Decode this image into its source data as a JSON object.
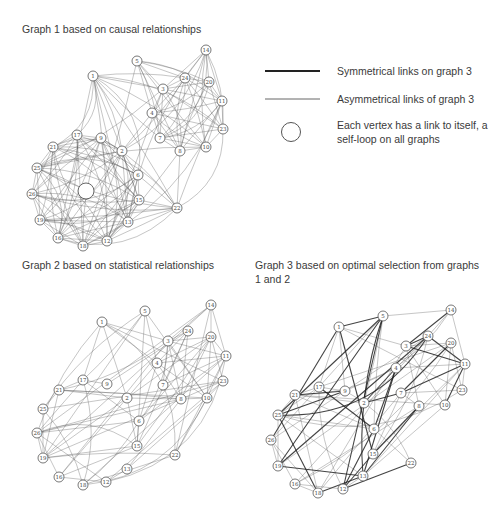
{
  "titles": {
    "graph1": "Graph 1 based on causal relationships",
    "graph2": "Graph 2 based on statistical relationships",
    "graph3": "Graph 3 based on optimal selection from graphs 1 and 2"
  },
  "legend": {
    "items": [
      {
        "symbol": "thick-line",
        "label": "Symmetrical links on graph 3"
      },
      {
        "symbol": "thin-line",
        "label": "Asymmetrical links of graph 3"
      },
      {
        "symbol": "circle",
        "label": "Each vertex has a link to itself, a self-loop on all graphs"
      }
    ]
  },
  "colors": {
    "edge": "#555555",
    "edge_light": "#8a8a8a",
    "edge_strong": "#222222",
    "text": "#3a3a3a"
  },
  "graphs": [
    {
      "id": "graph1",
      "nodes": [
        {
          "id": "1",
          "x": 93,
          "y": 76
        },
        {
          "id": "5",
          "x": 137,
          "y": 61
        },
        {
          "id": "14",
          "x": 206,
          "y": 50
        },
        {
          "id": "24",
          "x": 185,
          "y": 78
        },
        {
          "id": "20",
          "x": 209,
          "y": 82
        },
        {
          "id": "3",
          "x": 163,
          "y": 89
        },
        {
          "id": "11",
          "x": 222,
          "y": 101
        },
        {
          "id": "4",
          "x": 152,
          "y": 113
        },
        {
          "id": "23",
          "x": 223,
          "y": 129
        },
        {
          "id": "7",
          "x": 160,
          "y": 138
        },
        {
          "id": "8",
          "x": 180,
          "y": 151
        },
        {
          "id": "10",
          "x": 206,
          "y": 147
        },
        {
          "id": "17",
          "x": 77,
          "y": 135
        },
        {
          "id": "9",
          "x": 101,
          "y": 138
        },
        {
          "id": "21",
          "x": 53,
          "y": 147
        },
        {
          "id": "2",
          "x": 122,
          "y": 151
        },
        {
          "id": "25",
          "x": 37,
          "y": 168
        },
        {
          "id": "6",
          "x": 138,
          "y": 175
        },
        {
          "id": "26",
          "x": 32,
          "y": 194
        },
        {
          "id": "15",
          "x": 139,
          "y": 200
        },
        {
          "id": "22",
          "x": 177,
          "y": 208
        },
        {
          "id": "19",
          "x": 40,
          "y": 220
        },
        {
          "id": "13",
          "x": 128,
          "y": 222
        },
        {
          "id": "16",
          "x": 58,
          "y": 238
        },
        {
          "id": "18",
          "x": 83,
          "y": 246
        },
        {
          "id": "12",
          "x": 107,
          "y": 241
        }
      ],
      "self_loop_marker": {
        "x": 86,
        "y": 191,
        "r": 8
      }
    },
    {
      "id": "graph2",
      "nodes": [
        {
          "id": "1",
          "x": 102,
          "y": 322
        },
        {
          "id": "5",
          "x": 145,
          "y": 311
        },
        {
          "id": "14",
          "x": 211,
          "y": 305
        },
        {
          "id": "24",
          "x": 188,
          "y": 331
        },
        {
          "id": "20",
          "x": 211,
          "y": 337
        },
        {
          "id": "3",
          "x": 168,
          "y": 341
        },
        {
          "id": "11",
          "x": 226,
          "y": 356
        },
        {
          "id": "4",
          "x": 157,
          "y": 363
        },
        {
          "id": "23",
          "x": 223,
          "y": 381
        },
        {
          "id": "7",
          "x": 163,
          "y": 385
        },
        {
          "id": "8",
          "x": 181,
          "y": 399
        },
        {
          "id": "10",
          "x": 207,
          "y": 398
        },
        {
          "id": "17",
          "x": 83,
          "y": 380
        },
        {
          "id": "9",
          "x": 107,
          "y": 384
        },
        {
          "id": "21",
          "x": 59,
          "y": 390
        },
        {
          "id": "2",
          "x": 127,
          "y": 398
        },
        {
          "id": "25",
          "x": 43,
          "y": 409
        },
        {
          "id": "6",
          "x": 139,
          "y": 421
        },
        {
          "id": "26",
          "x": 37,
          "y": 433
        },
        {
          "id": "15",
          "x": 137,
          "y": 446
        },
        {
          "id": "22",
          "x": 175,
          "y": 455
        },
        {
          "id": "19",
          "x": 43,
          "y": 458
        },
        {
          "id": "13",
          "x": 127,
          "y": 469
        },
        {
          "id": "16",
          "x": 59,
          "y": 477
        },
        {
          "id": "18",
          "x": 83,
          "y": 485
        },
        {
          "id": "12",
          "x": 106,
          "y": 482
        }
      ]
    },
    {
      "id": "graph3",
      "nodes": [
        {
          "id": "1",
          "x": 339,
          "y": 327
        },
        {
          "id": "5",
          "x": 383,
          "y": 316
        },
        {
          "id": "14",
          "x": 451,
          "y": 310
        },
        {
          "id": "24",
          "x": 428,
          "y": 336
        },
        {
          "id": "20",
          "x": 451,
          "y": 343
        },
        {
          "id": "3",
          "x": 406,
          "y": 346
        },
        {
          "id": "11",
          "x": 465,
          "y": 364
        },
        {
          "id": "4",
          "x": 396,
          "y": 368
        },
        {
          "id": "23",
          "x": 462,
          "y": 390
        },
        {
          "id": "7",
          "x": 401,
          "y": 393
        },
        {
          "id": "8",
          "x": 419,
          "y": 406
        },
        {
          "id": "10",
          "x": 445,
          "y": 405
        },
        {
          "id": "17",
          "x": 319,
          "y": 387
        },
        {
          "id": "9",
          "x": 345,
          "y": 391
        },
        {
          "id": "21",
          "x": 295,
          "y": 395
        },
        {
          "id": "2",
          "x": 364,
          "y": 403
        },
        {
          "id": "25",
          "x": 278,
          "y": 415
        },
        {
          "id": "6",
          "x": 374,
          "y": 429
        },
        {
          "id": "26",
          "x": 271,
          "y": 440
        },
        {
          "id": "15",
          "x": 373,
          "y": 454
        },
        {
          "id": "22",
          "x": 411,
          "y": 463
        },
        {
          "id": "19",
          "x": 278,
          "y": 466
        },
        {
          "id": "13",
          "x": 363,
          "y": 476
        },
        {
          "id": "16",
          "x": 295,
          "y": 484
        },
        {
          "id": "18",
          "x": 318,
          "y": 493
        },
        {
          "id": "12",
          "x": 343,
          "y": 489
        }
      ]
    }
  ]
}
